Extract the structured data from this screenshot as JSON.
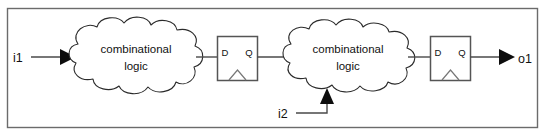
{
  "figure": {
    "name": "sequential-logic-block-diagram",
    "background_color": "#ffffff",
    "frame_color": "#6b6b6b",
    "wire_color": "#4a4a4a",
    "ink_color": "#2b2b2b"
  },
  "inputs": [
    {
      "id": "i1",
      "label": "i1",
      "target": "combinational-logic-1"
    },
    {
      "id": "i2",
      "label": "i2",
      "target": "combinational-logic-2"
    }
  ],
  "outputs": [
    {
      "id": "o1",
      "label": "o1",
      "source": "flip-flop-2"
    }
  ],
  "clouds": [
    {
      "id": "combinational-logic-1",
      "line1": "combinational",
      "line2": "logic"
    },
    {
      "id": "combinational-logic-2",
      "line1": "combinational",
      "line2": "logic"
    }
  ],
  "flipflops": [
    {
      "id": "flip-flop-1",
      "d_label": "D",
      "q_label": "Q",
      "clock_symbol": "triangle"
    },
    {
      "id": "flip-flop-2",
      "d_label": "D",
      "q_label": "Q",
      "clock_symbol": "triangle"
    }
  ]
}
